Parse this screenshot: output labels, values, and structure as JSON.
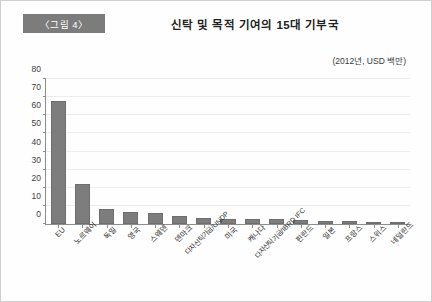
{
  "header": {
    "badge_label": "〈그림 4〉",
    "title": "신탁 및 목적 기여의 15대 기부국",
    "unit_note": "(2012년, USD 백만)"
  },
  "colors": {
    "badge_background": "#7c7c7c",
    "bar_fill": "#7d7d7d",
    "axis": "#8d8d8d",
    "gridline": "#ececec",
    "page_background": "#ffffff"
  },
  "chart_data": {
    "type": "bar",
    "title": "신탁 및 목적 기여의 15대 기부국",
    "subtitle": "(2012년, USD 백만)",
    "xlabel": "",
    "ylabel": "",
    "ylim": [
      0,
      80
    ],
    "yticks": [
      0,
      10,
      20,
      30,
      40,
      50,
      60,
      70,
      80
    ],
    "ytick_labels": [
      "0",
      "10",
      "20",
      "30",
      "40",
      "50",
      "60",
      "70",
      "80"
    ],
    "grid": true,
    "legend": false,
    "categories": [
      "EU",
      "노르웨이",
      "독일",
      "영국",
      "스웨덴",
      "덴마크",
      "다자신탁기금/UNDP",
      "미국",
      "캐나다",
      "다자신탁기금/IBRD IFC",
      "핀란드",
      "일본",
      "프랑스",
      "스위스",
      "네덜란드"
    ],
    "values": [
      68,
      22,
      8.5,
      6.5,
      6,
      4.5,
      3.5,
      3,
      2.8,
      2.5,
      2,
      1.8,
      1.5,
      1.2,
      1
    ]
  }
}
